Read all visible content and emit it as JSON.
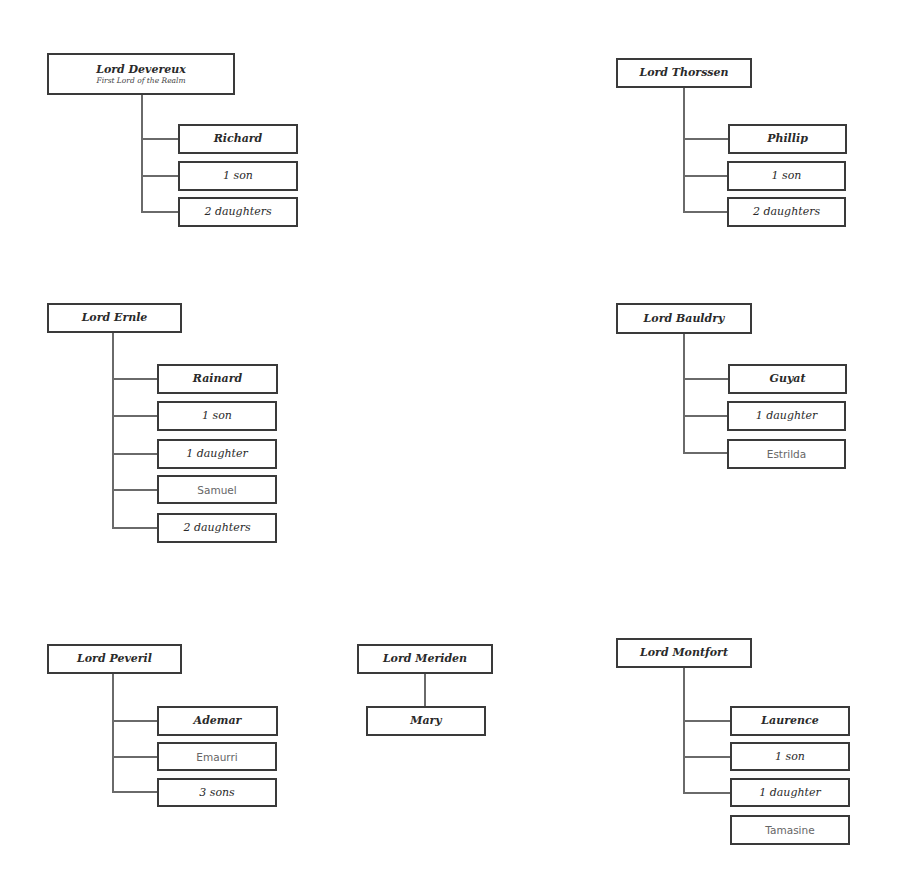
{
  "families": [
    {
      "id": "devereux",
      "lord": "Lord Devereux",
      "subtitle": "First Lord of the Realm",
      "children": [
        {
          "label": "Richard",
          "type": "heir"
        },
        {
          "label": "1 son",
          "type": "group"
        },
        {
          "label": "2 daughters",
          "type": "group"
        }
      ]
    },
    {
      "id": "thorssen",
      "lord": "Lord Thorssen",
      "children": [
        {
          "label": "Phillip",
          "type": "heir"
        },
        {
          "label": "1 son",
          "type": "group"
        },
        {
          "label": "2 daughters",
          "type": "group"
        }
      ]
    },
    {
      "id": "ernle",
      "lord": "Lord Ernle",
      "children": [
        {
          "label": "Rainard",
          "type": "heir"
        },
        {
          "label": "1 son",
          "type": "group"
        },
        {
          "label": "1 daughter",
          "type": "group"
        },
        {
          "label": "Samuel",
          "type": "named"
        },
        {
          "label": "2 daughters",
          "type": "group"
        }
      ]
    },
    {
      "id": "bauldry",
      "lord": "Lord Bauldry",
      "children": [
        {
          "label": "Guyat",
          "type": "heir"
        },
        {
          "label": "1 daughter",
          "type": "group"
        },
        {
          "label": "Estrilda",
          "type": "named"
        }
      ]
    },
    {
      "id": "peveril",
      "lord": "Lord Peveril",
      "children": [
        {
          "label": "Ademar",
          "type": "heir"
        },
        {
          "label": "Emaurri",
          "type": "named"
        },
        {
          "label": "3 sons",
          "type": "group"
        }
      ]
    },
    {
      "id": "meriden",
      "lord": "Lord Meriden",
      "children": [
        {
          "label": "Mary",
          "type": "heir"
        }
      ]
    },
    {
      "id": "montfort",
      "lord": "Lord Montfort",
      "children": [
        {
          "label": "Laurence",
          "type": "heir"
        },
        {
          "label": "1 son",
          "type": "group"
        },
        {
          "label": "1 daughter",
          "type": "group"
        },
        {
          "label": "Tamasine",
          "type": "named"
        }
      ]
    }
  ]
}
